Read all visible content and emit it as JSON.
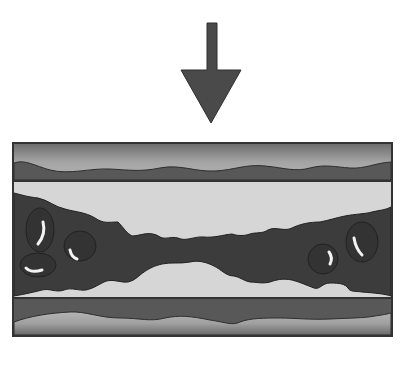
{
  "diagram": {
    "title": "",
    "arrow": {
      "direction": "down",
      "color": "#4a4a4a"
    },
    "vessel": {
      "outer_border_color": "#3a3a3a",
      "wall_light_color": "#a8a8a8",
      "wall_dark_color": "#5a5a5a",
      "lumen_color": "#d6d6d6",
      "clot_color": "#3c3c3c",
      "cell_highlight_color": "#f2f2f2"
    },
    "labels": []
  }
}
